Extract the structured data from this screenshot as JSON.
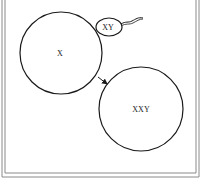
{
  "diagram": {
    "colors": {
      "stroke": "#1a1a1a",
      "frame": "#8a8a8a",
      "background": "#ffffff"
    },
    "cells": [
      {
        "id": "egg",
        "label": "X",
        "cx": 61,
        "cy": 53,
        "r": 41
      },
      {
        "id": "zygote",
        "label": "XXY",
        "cx": 141,
        "cy": 109,
        "r": 42
      }
    ],
    "sperm": {
      "label": "XY",
      "cx": 109,
      "cy": 27,
      "rx": 13,
      "ry": 9
    },
    "arrow": {
      "from": [
        98,
        77
      ],
      "to": [
        108,
        85
      ]
    }
  }
}
